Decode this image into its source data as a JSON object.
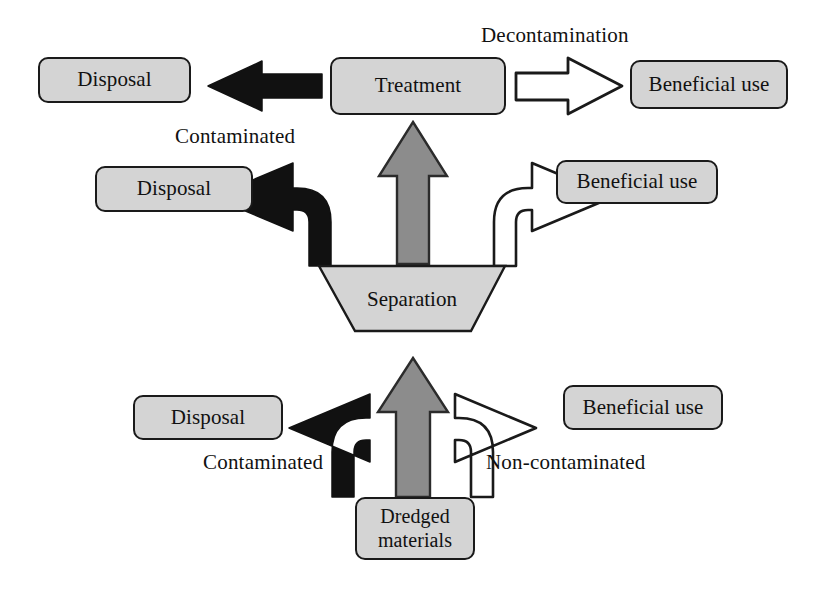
{
  "diagram": {
    "background_color": "#ffffff",
    "node_fill": "#d4d4d4",
    "node_stroke": "#1a1a1a",
    "black_arrow_color": "#111111",
    "gray_arrow_color": "#8c8c8c",
    "white_arrow_fill": "#ffffff",
    "nodes": {
      "source": {
        "line1": "Dredged",
        "line2": "materials"
      },
      "separation": {
        "label": "Separation"
      },
      "treatment": {
        "label": "Treatment"
      },
      "disposal_bottom": {
        "label": "Disposal"
      },
      "disposal_middle": {
        "label": "Disposal"
      },
      "disposal_top": {
        "label": "Disposal"
      },
      "beneficial_bottom": {
        "label": "Beneficial use"
      },
      "beneficial_middle": {
        "label": "Beneficial use"
      },
      "beneficial_top": {
        "label": "Beneficial use"
      }
    },
    "edge_labels": {
      "bottom_left": "Contaminated",
      "bottom_right": "Non-contaminated",
      "middle_left": "Contaminated",
      "top_right": "Decontamination"
    }
  }
}
